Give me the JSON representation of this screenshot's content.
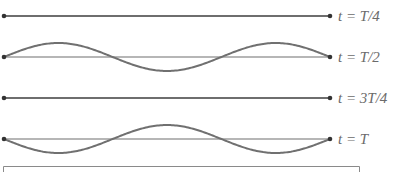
{
  "diagram": {
    "rows": [
      {
        "label": "t = T/4",
        "shape": "flat",
        "y": 16
      },
      {
        "label": "t = T/2",
        "shape": "wave",
        "y": 57,
        "phase": 1
      },
      {
        "label": "t = 3T/4",
        "shape": "flat",
        "y": 98
      },
      {
        "label": "t = T",
        "shape": "wave",
        "y": 139,
        "phase": -1
      }
    ],
    "amplitude": 14,
    "half_wavelengths": 3,
    "line_color": "#6e6e6e",
    "wave_color": "#707070"
  }
}
